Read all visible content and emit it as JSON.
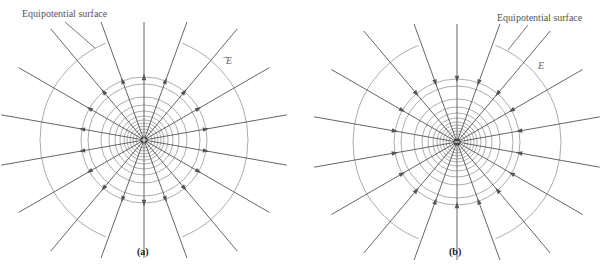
{
  "panels": [
    {
      "id": "a",
      "caption": "(a)",
      "charge": "+",
      "direction": "outward",
      "center": [
        144,
        140
      ],
      "label_equipotential": "Equipotential surface",
      "label_field": "E"
    },
    {
      "id": "b",
      "caption": "(b)",
      "charge": "−",
      "direction": "inward",
      "center": [
        457,
        142
      ],
      "label_equipotential": "Equipotential surface",
      "label_field": "E"
    }
  ],
  "colors": {
    "field_line": "#555555",
    "equipotential": "#888888",
    "text": "#555555"
  }
}
